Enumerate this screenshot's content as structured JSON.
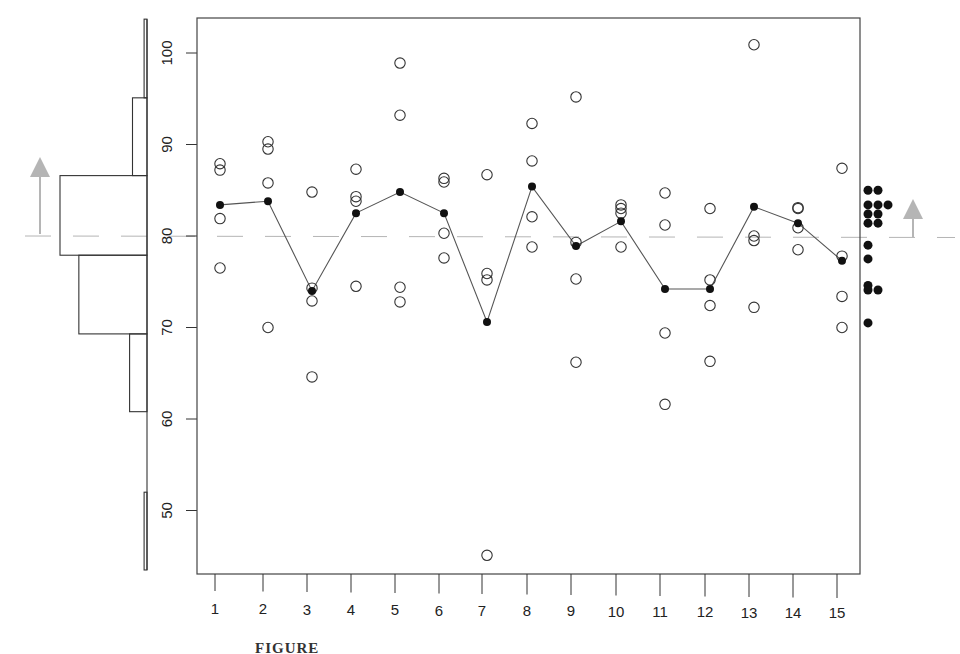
{
  "figure": {
    "caption": "FIGURE"
  },
  "chart_data": {
    "type": "scatter",
    "title": "",
    "xlabel": "",
    "ylabel": "",
    "ylim": [
      43.5,
      104
    ],
    "y_ticks": [
      50,
      60,
      70,
      80,
      90,
      100
    ],
    "categories": [
      "1",
      "2",
      "3",
      "4",
      "5",
      "6",
      "7",
      "8",
      "9",
      "10",
      "11",
      "12",
      "13",
      "14",
      "15"
    ],
    "grid": false,
    "reference_line": {
      "value": 80.0,
      "style": "dashed",
      "color": "#b5b5b5"
    },
    "series": [
      {
        "name": "observations",
        "marker": "open-circle",
        "points": [
          [
            87.9,
            87.2,
            81.9,
            76.5
          ],
          [
            90.3,
            89.5,
            85.8,
            70.0
          ],
          [
            84.8,
            74.3,
            72.9,
            64.6
          ],
          [
            87.3,
            84.3,
            83.8,
            74.5
          ],
          [
            98.9,
            93.2,
            74.4,
            72.8
          ],
          [
            86.3,
            85.9,
            80.3,
            77.6
          ],
          [
            86.7,
            75.9,
            75.2,
            45.1
          ],
          [
            92.3,
            88.2,
            82.1,
            78.8
          ],
          [
            95.2,
            79.3,
            75.3,
            66.2
          ],
          [
            83.4,
            83.0,
            82.5,
            78.8
          ],
          [
            84.7,
            81.2,
            69.4,
            61.6
          ],
          [
            83.0,
            75.2,
            72.4,
            66.3
          ],
          [
            100.9,
            80.0,
            79.5,
            72.2
          ],
          [
            83.1,
            83.0,
            80.9,
            78.5
          ],
          [
            87.4,
            77.8,
            73.4,
            70.0
          ]
        ]
      },
      {
        "name": "group means",
        "marker": "filled-circle",
        "connected": true,
        "values": [
          83.4,
          83.8,
          74.0,
          82.5,
          84.8,
          82.5,
          70.6,
          85.4,
          78.9,
          81.6,
          74.2,
          74.2,
          83.2,
          81.4,
          77.3
        ]
      }
    ],
    "left_histogram": {
      "orientation": "horizontal",
      "bins": [
        {
          "from": 95.1,
          "to": 103.7,
          "count": 0.2
        },
        {
          "from": 86.6,
          "to": 95.1,
          "count": 1
        },
        {
          "from": 77.9,
          "to": 86.6,
          "count": 6
        },
        {
          "from": 69.3,
          "to": 77.9,
          "count": 4.7
        },
        {
          "from": 60.8,
          "to": 69.3,
          "count": 1.2
        },
        {
          "from": 52.0,
          "to": 60.8,
          "count": 0
        },
        {
          "from": 43.5,
          "to": 52.0,
          "count": 0.2
        }
      ]
    },
    "right_dotplot": {
      "description": "Stacked dot plot of the 15 group means",
      "rows": [
        {
          "value": 85.0,
          "count": 2
        },
        {
          "value": 83.4,
          "count": 3
        },
        {
          "value": 82.4,
          "count": 2
        },
        {
          "value": 81.4,
          "count": 2
        },
        {
          "value": 79.0,
          "count": 1
        },
        {
          "value": 77.5,
          "count": 1
        },
        {
          "value": 74.6,
          "count": 1
        },
        {
          "value": 74.1,
          "count": 2
        },
        {
          "value": 70.5,
          "count": 1
        }
      ]
    },
    "annotations": [
      {
        "type": "arrow-up",
        "side": "left",
        "color": "#b5b5b5",
        "base_value": 80.0
      },
      {
        "type": "arrow-up",
        "side": "right",
        "color": "#b5b5b5",
        "base_value": 80.0
      }
    ]
  }
}
